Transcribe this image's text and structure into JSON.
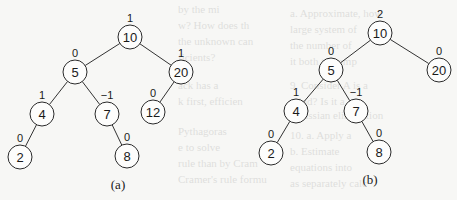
{
  "background_text": {
    "lines": [
      {
        "x": 178,
        "y": 8,
        "text": "by the mi"
      },
      {
        "x": 178,
        "y": 24,
        "text": "w? How does th"
      },
      {
        "x": 178,
        "y": 40,
        "text": "the unknown can"
      },
      {
        "x": 178,
        "y": 56,
        "text": "ficients?"
      },
      {
        "x": 178,
        "y": 84,
        "text": "ack has a"
      },
      {
        "x": 178,
        "y": 100,
        "text": "k first, efficien"
      },
      {
        "x": 178,
        "y": 130,
        "text": "Pythagoras"
      },
      {
        "x": 178,
        "y": 146,
        "text": "e to solve"
      },
      {
        "x": 178,
        "y": 162,
        "text": "rule than by Cram"
      },
      {
        "x": 178,
        "y": 178,
        "text": "Cramer's rule formu"
      },
      {
        "x": 290,
        "y": 12,
        "text": "a. Approximate, how"
      },
      {
        "x": 290,
        "y": 28,
        "text": "large system of"
      },
      {
        "x": 290,
        "y": 44,
        "text": "the number of"
      },
      {
        "x": 290,
        "y": 60,
        "text": "it both to comp"
      },
      {
        "x": 290,
        "y": 84,
        "text": "9. Consider A is a"
      },
      {
        "x": 290,
        "y": 100,
        "text": "mind? Is it a"
      },
      {
        "x": 290,
        "y": 114,
        "text": "Gaussian elimination"
      },
      {
        "x": 290,
        "y": 134,
        "text": "10. a. Apply a"
      },
      {
        "x": 290,
        "y": 150,
        "text": "b. Estimate"
      },
      {
        "x": 290,
        "y": 166,
        "text": "equations into"
      },
      {
        "x": 290,
        "y": 182,
        "text": "as separately calc"
      }
    ]
  },
  "diagram": {
    "trees": [
      {
        "caption": "(a)",
        "caption_pos": {
          "x": 118,
          "y": 189
        },
        "nodes": [
          {
            "id": "a10",
            "value": "10",
            "balance": "1",
            "x": 130,
            "y": 37
          },
          {
            "id": "a5",
            "value": "5",
            "balance": "0",
            "x": 75,
            "y": 72
          },
          {
            "id": "a20",
            "value": "20",
            "balance": "1",
            "x": 181,
            "y": 72
          },
          {
            "id": "a4",
            "value": "4",
            "balance": "1",
            "x": 42,
            "y": 114
          },
          {
            "id": "a7",
            "value": "7",
            "balance": "−1",
            "x": 107,
            "y": 114
          },
          {
            "id": "a12",
            "value": "12",
            "balance": "0",
            "x": 153,
            "y": 112
          },
          {
            "id": "a2",
            "value": "2",
            "balance": "0",
            "x": 20,
            "y": 157
          },
          {
            "id": "a8",
            "value": "8",
            "balance": "0",
            "x": 127,
            "y": 156
          }
        ],
        "edges": [
          [
            "a10",
            "a5"
          ],
          [
            "a10",
            "a20"
          ],
          [
            "a5",
            "a4"
          ],
          [
            "a5",
            "a7"
          ],
          [
            "a20",
            "a12"
          ],
          [
            "a4",
            "a2"
          ],
          [
            "a7",
            "a8"
          ]
        ]
      },
      {
        "caption": "(b)",
        "caption_pos": {
          "x": 370,
          "y": 184
        },
        "nodes": [
          {
            "id": "b10",
            "value": "10",
            "balance": "2",
            "x": 380,
            "y": 33
          },
          {
            "id": "b5",
            "value": "5",
            "balance": "0",
            "x": 331,
            "y": 70
          },
          {
            "id": "b20",
            "value": "20",
            "balance": "0",
            "x": 439,
            "y": 70
          },
          {
            "id": "b4",
            "value": "4",
            "balance": "1",
            "x": 296,
            "y": 111
          },
          {
            "id": "b7",
            "value": "7",
            "balance": "−1",
            "x": 356,
            "y": 111
          },
          {
            "id": "b2",
            "value": "2",
            "balance": "0",
            "x": 271,
            "y": 153
          },
          {
            "id": "b8",
            "value": "8",
            "balance": "0",
            "x": 379,
            "y": 152
          }
        ],
        "edges": [
          [
            "b10",
            "b5"
          ],
          [
            "b10",
            "b20"
          ],
          [
            "b5",
            "b4"
          ],
          [
            "b5",
            "b7"
          ],
          [
            "b4",
            "b2"
          ],
          [
            "b7",
            "b8"
          ]
        ]
      }
    ],
    "node_radius": 12
  }
}
